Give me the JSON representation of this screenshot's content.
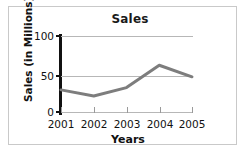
{
  "chart_data": {
    "type": "line",
    "title": "Sales",
    "xlabel": "Years",
    "ylabel": "Sales (in Millions)",
    "categories": [
      "2001",
      "2002",
      "2003",
      "2004",
      "2005"
    ],
    "values": [
      30,
      22,
      33,
      62,
      47
    ],
    "series": [
      {
        "name": "Sales",
        "values": [
          30,
          22,
          33,
          62,
          47
        ]
      }
    ],
    "ylim": [
      0,
      100
    ],
    "yticks": [
      0,
      50,
      100
    ],
    "ytick_labels": [
      "0",
      "50",
      "100"
    ],
    "grid": "horizontal",
    "legend": "none",
    "line_color": "#7d7d7d",
    "line_width": 3,
    "markers": "none",
    "axis_color": "#111111",
    "gridline_color": "#b7b7b7",
    "background": "#ffffff",
    "border_color": "#c9c9c9"
  }
}
